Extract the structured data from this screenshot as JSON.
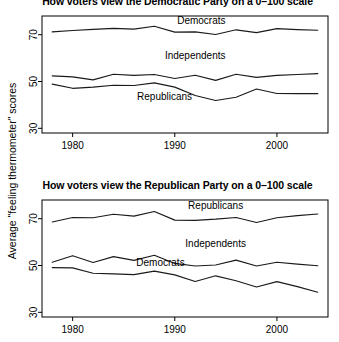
{
  "figure": {
    "ylabel": "Average \"feeling thermometer\" scores"
  },
  "panels": {
    "top": {
      "title": "How voters view the Democratic Party on a 0–100 scale",
      "ytick_labels": [
        "30",
        "50",
        "70"
      ],
      "xtick_labels": [
        "1980",
        "1990",
        "2000"
      ],
      "series_labels": {
        "democrats": "Democrats",
        "independents": "Independents",
        "republicans": "Republicans"
      }
    },
    "bottom": {
      "title": "How voters view the Republican Party on a 0–100 scale",
      "ytick_labels": [
        "30",
        "50",
        "70"
      ],
      "xtick_labels": [
        "1980",
        "1990",
        "2000"
      ],
      "series_labels": {
        "republicans": "Republicans",
        "independents": "Independents",
        "democrats": "Democrats"
      }
    }
  },
  "chart_data": [
    {
      "type": "line",
      "title": "How voters view the Democratic Party on a 0–100 scale",
      "xlabel": "",
      "ylabel": "Average \"feeling thermometer\" scores",
      "x": [
        1978,
        1980,
        1982,
        1984,
        1986,
        1988,
        1990,
        1992,
        1994,
        1996,
        1998,
        2000,
        2002,
        2004
      ],
      "xlim": [
        1977,
        2005
      ],
      "ylim": [
        28,
        78
      ],
      "xticks": [
        1980,
        1990,
        2000
      ],
      "yticks": [
        30,
        50,
        70
      ],
      "grid": false,
      "legend": "inline-labels",
      "series": [
        {
          "name": "Democrats",
          "values": [
            71.2,
            71.8,
            72.3,
            72.7,
            72.4,
            73.6,
            71.1,
            71.2,
            70.1,
            72.1,
            70.9,
            72.6,
            72.2,
            71.9
          ]
        },
        {
          "name": "Independents",
          "values": [
            52.4,
            52.0,
            50.7,
            53.1,
            52.6,
            53.0,
            51.3,
            52.7,
            50.5,
            53.1,
            51.8,
            52.6,
            53.0,
            53.4
          ]
        },
        {
          "name": "Republicans",
          "values": [
            48.9,
            47.1,
            47.6,
            48.4,
            48.3,
            49.4,
            47.6,
            44.0,
            41.9,
            43.3,
            46.8,
            44.9,
            44.8,
            44.8
          ]
        }
      ]
    },
    {
      "type": "line",
      "title": "How voters view the Republican Party on a 0–100 scale",
      "xlabel": "",
      "ylabel": "Average \"feeling thermometer\" scores",
      "x": [
        1978,
        1980,
        1982,
        1984,
        1986,
        1988,
        1990,
        1992,
        1994,
        1996,
        1998,
        2000,
        2002,
        2004
      ],
      "xlim": [
        1977,
        2005
      ],
      "ylim": [
        28,
        78
      ],
      "xticks": [
        1980,
        1990,
        2000
      ],
      "yticks": [
        30,
        50,
        70
      ],
      "grid": false,
      "legend": "inline-labels",
      "series": [
        {
          "name": "Republicans",
          "values": [
            68.6,
            70.5,
            70.4,
            71.9,
            71.1,
            73.1,
            69.4,
            69.3,
            69.8,
            70.5,
            68.4,
            70.4,
            71.3,
            72.0
          ]
        },
        {
          "name": "Independents",
          "values": [
            51.4,
            54.2,
            51.3,
            53.8,
            52.2,
            54.4,
            50.9,
            49.8,
            50.2,
            52.3,
            49.8,
            51.4,
            50.6,
            49.9
          ]
        },
        {
          "name": "Democrats",
          "values": [
            49.1,
            49.0,
            46.7,
            46.4,
            46.1,
            47.6,
            46.0,
            43.2,
            45.6,
            43.5,
            40.8,
            43.1,
            41.0,
            38.6
          ]
        }
      ]
    }
  ]
}
